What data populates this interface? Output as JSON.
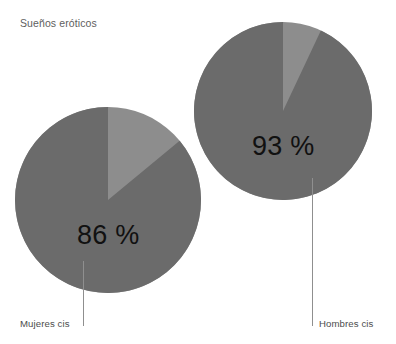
{
  "chart": {
    "title": "Sueños eróticos",
    "background_color": "#ffffff",
    "title_color": "#5e5e5e",
    "label_color": "#4d4d4d",
    "value_color": "#111111",
    "leader_line_color": "#8f8f8f"
  },
  "chart_data": {
    "type": "pie",
    "title": "Sueños eróticos",
    "xlabel": "",
    "ylabel": "",
    "legend": "none",
    "grid": false,
    "annotations": [
      "Sueños eróticos"
    ],
    "colors": {
      "primary": "#6b6b6b",
      "remainder": "#8d8d8d"
    },
    "charts": [
      {
        "name": "mujeres-cis",
        "category": "Mujeres cis",
        "value": 86,
        "value_label": "86 %",
        "slices": [
          {
            "label": "Sí",
            "value": 86,
            "color": "#6b6b6b"
          },
          {
            "label": "No",
            "value": 14,
            "color": "#8d8d8d"
          }
        ],
        "center": {
          "x": 108,
          "y": 200
        },
        "radius": 93
      },
      {
        "name": "hombres-cis",
        "category": "Hombres cis",
        "value": 93,
        "value_label": "93 %",
        "slices": [
          {
            "label": "Sí",
            "value": 93,
            "color": "#6b6b6b"
          },
          {
            "label": "No",
            "value": 7,
            "color": "#8d8d8d"
          }
        ],
        "center": {
          "x": 283,
          "y": 111
        },
        "radius": 89
      }
    ]
  },
  "pies": {
    "women": {
      "category_label": "Mujeres cis",
      "percent_label": "86 %"
    },
    "men": {
      "category_label": "Hombres cis",
      "percent_label": "93 %"
    }
  }
}
